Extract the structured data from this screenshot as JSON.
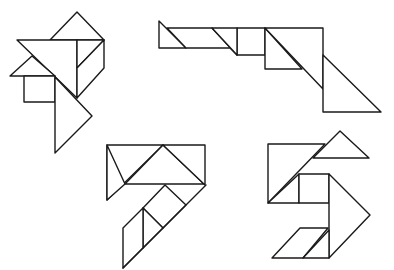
{
  "colors": {
    "stroke": "#1a1a1a",
    "background": "#ffffff"
  },
  "figures": [
    {
      "name": "tangram-figure-top-left",
      "pieces": [
        {
          "name": "small-triangle-top",
          "points": "77,12 104,40 50,40"
        },
        {
          "name": "large-triangle",
          "points": "17,40 77,40 77,98"
        },
        {
          "name": "medium-area",
          "points": "77,40 104,40 77,68"
        },
        {
          "name": "parallelogram",
          "points": "77,68 104,40 104,68 77,98"
        },
        {
          "name": "small-triangle-left",
          "points": "10,76 32,56 55,76"
        },
        {
          "name": "square",
          "points": "24,76 55,76 55,102 24,102"
        },
        {
          "name": "large-triangle-bottom",
          "points": "55,77 92,116 55,153"
        }
      ]
    },
    {
      "name": "tangram-figure-top-right",
      "pieces": [
        {
          "name": "small-triangle-left",
          "points": "159,21 159,48 186,48"
        },
        {
          "name": "parallelogram",
          "points": "167,28 212,28 237,55 230,48 186,48"
        },
        {
          "name": "square",
          "points": "237,28 265,28 265,55 237,55"
        },
        {
          "name": "small-triangle-mid",
          "points": "212,28 237,28 237,55"
        },
        {
          "name": "medium-triangle",
          "points": "265,28 265,69 302,69"
        },
        {
          "name": "large-triangle",
          "points": "265,28 323,28 323,89"
        },
        {
          "name": "large-triangle-right",
          "points": "323,55 381,112 323,112"
        }
      ]
    },
    {
      "name": "tangram-figure-bottom-left",
      "pieces": [
        {
          "name": "large-triangle-left",
          "points": "107,145 163,145 107,200"
        },
        {
          "name": "left-sliver",
          "points": "107,200 125,184 107,145"
        },
        {
          "name": "medium-triangle-top",
          "points": "163,145 125,184 204,184"
        },
        {
          "name": "large-triangle-right",
          "points": "163,145 205,145 205,185"
        },
        {
          "name": "square",
          "points": "165,185 186,205 163,228 143,208"
        },
        {
          "name": "small-triangle",
          "points": "143,208 163,228 143,248"
        },
        {
          "name": "parallelogram",
          "points": "123,228 143,208 143,248 123,268"
        },
        {
          "name": "diagonal-strip",
          "points": "186,205 206,185 123,268 143,248 163,228"
        }
      ]
    },
    {
      "name": "tangram-figure-bottom-right",
      "pieces": [
        {
          "name": "large-triangle-left",
          "points": "268,144 325,144 268,203"
        },
        {
          "name": "small-triangle-top",
          "points": "340,131 369,158 313,158"
        },
        {
          "name": "medium-triangle",
          "points": "268,203 299,174 299,203"
        },
        {
          "name": "square",
          "points": "299,174 329,174 329,203 299,203"
        },
        {
          "name": "large-triangle-right",
          "points": "329,174 370,215 329,258"
        },
        {
          "name": "parallelogram-left",
          "points": "272,258 300,228 328,228 303,258"
        },
        {
          "name": "small-triangle-bottom",
          "points": "303,258 329,230 329,258"
        }
      ]
    }
  ]
}
